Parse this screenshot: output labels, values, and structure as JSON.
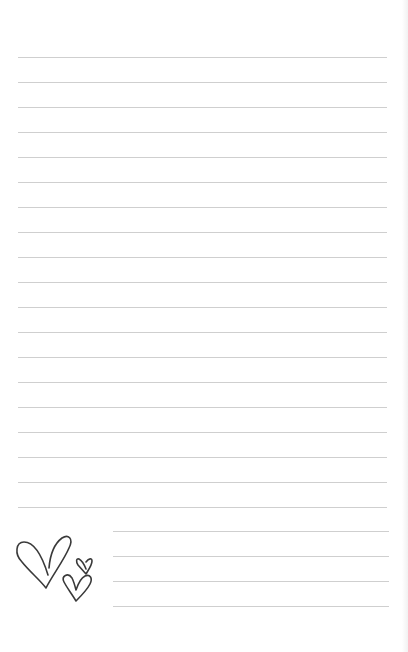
{
  "page": {
    "type": "lined-notepaper",
    "background": "#ffffff",
    "line_color": "#cfcfcf",
    "ink_color": "#3a3a3a",
    "full_lines": {
      "count": 19,
      "start_y": 57,
      "spacing": 25,
      "left": 18,
      "right": 387
    },
    "short_lines": {
      "count": 4,
      "start_y": 531,
      "spacing": 25,
      "left": 113,
      "right": 389
    },
    "decoration": {
      "icon": "hearts-doodle-icon",
      "count": 3
    }
  }
}
